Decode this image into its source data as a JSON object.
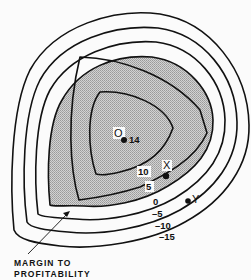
{
  "diagram": {
    "type": "contour-map",
    "shaded_region": "profitable area (contour >= 0)",
    "colors": {
      "line": "#111111",
      "shade": "#bdbdbd",
      "background": "#fbfbfb"
    },
    "contours": [
      {
        "value": "-15",
        "label": "–15"
      },
      {
        "value": "-10",
        "label": "–10"
      },
      {
        "value": "-5",
        "label": "–5"
      },
      {
        "value": "0",
        "label": "0"
      },
      {
        "value": "5",
        "label": "5"
      },
      {
        "value": "10",
        "label": "10"
      }
    ],
    "points": {
      "optimum": {
        "label": "O",
        "value": "14"
      },
      "x": {
        "label": "X"
      },
      "y": {
        "label": "Y"
      }
    },
    "annotation": {
      "line1": "MARGIN TO",
      "line2": "PROFITABILITY"
    }
  }
}
